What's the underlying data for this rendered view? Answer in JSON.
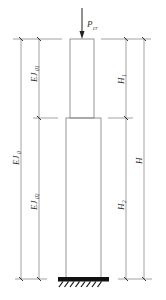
{
  "diagram": {
    "type": "stepped-column-buckling",
    "load": {
      "symbol": "P",
      "subscript": "cr"
    },
    "left_dimensions": {
      "overall": {
        "symbol": "EJ",
        "subscript": "0"
      },
      "upper": {
        "symbol": "EJ",
        "subscript": "01"
      },
      "lower": {
        "symbol": "EJ",
        "subscript": "02"
      }
    },
    "right_dimensions": {
      "upper": {
        "symbol": "H",
        "subscript": "1"
      },
      "lower": {
        "symbol": "H",
        "subscript": "2"
      },
      "overall": {
        "symbol": "H",
        "subscript": ""
      }
    },
    "support": "fixed-base",
    "colors": {
      "lines": "#8a8a8a",
      "base": "#111111",
      "text": "#333333"
    }
  }
}
